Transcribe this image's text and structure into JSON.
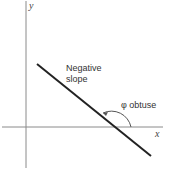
{
  "diagram": {
    "title": "",
    "axes": {
      "x_label": "x",
      "y_label": "y",
      "color": "#8a8a8a"
    },
    "line": {
      "description": "Line with negative slope",
      "color": "#222222"
    },
    "labels": {
      "slope_line1": "Negative",
      "slope_line2": "slope",
      "angle": "φ obtuse"
    },
    "angle_arc_color": "#555555"
  }
}
